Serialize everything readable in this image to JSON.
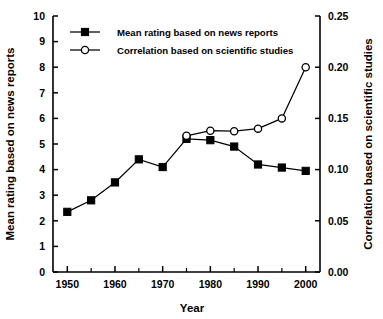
{
  "chart_data": {
    "type": "line",
    "title": "",
    "xlabel": "Year",
    "ylabel": "Mean rating based on news reports",
    "ylabel_right": "Correlation based on scientific studies",
    "x": [
      1950,
      1955,
      1960,
      1965,
      1970,
      1975,
      1980,
      1985,
      1990,
      1995,
      2000
    ],
    "xlim": [
      1947,
      2003
    ],
    "ylim": [
      0,
      10
    ],
    "ylim_right": [
      0.0,
      0.25
    ],
    "grid": false,
    "legend_position": "upper left inside",
    "xticks": [
      1950,
      1960,
      1970,
      1980,
      1990,
      2000
    ],
    "xticklabels": [
      "1950",
      "1960",
      "1970",
      "1980",
      "1990",
      "2000"
    ],
    "xminorticks": [
      1955,
      1965,
      1975,
      1985,
      1995
    ],
    "yticks": [
      0,
      1,
      2,
      3,
      4,
      5,
      6,
      7,
      8,
      9,
      10
    ],
    "yticklabels": [
      "0",
      "1",
      "2",
      "3",
      "4",
      "5",
      "6",
      "7",
      "8",
      "9",
      "10"
    ],
    "yticks_right": [
      0.0,
      0.05,
      0.1,
      0.15,
      0.2,
      0.25
    ],
    "yticklabels_right": [
      "0.00",
      "0.05",
      "0.10",
      "0.15",
      "0.20",
      "0.25"
    ],
    "series": [
      {
        "name": "Mean rating based on news reports",
        "axis": "left",
        "marker": "filled-square",
        "x": [
          1950,
          1955,
          1960,
          1965,
          1970,
          1975,
          1980,
          1985,
          1990,
          1995,
          2000
        ],
        "values": [
          2.35,
          2.8,
          3.5,
          4.4,
          4.1,
          5.2,
          5.15,
          4.9,
          4.2,
          4.08,
          3.95
        ]
      },
      {
        "name": "Correlation based on scientific studies",
        "axis": "right",
        "marker": "open-circle",
        "x": [
          1975,
          1980,
          1985,
          1990,
          1995,
          2000
        ],
        "values": [
          0.133,
          0.138,
          0.1375,
          0.14,
          0.15,
          0.2
        ]
      }
    ]
  },
  "legend": {
    "entries": [
      {
        "label": "Mean rating based on news reports",
        "marker": "filled-square"
      },
      {
        "label": "Correlation based on scientific studies",
        "marker": "open-circle"
      }
    ]
  },
  "axes": {
    "x_title": "Year",
    "y_left_title": "Mean rating based on news reports",
    "y_right_title": "Correlation based on scientific studies"
  }
}
